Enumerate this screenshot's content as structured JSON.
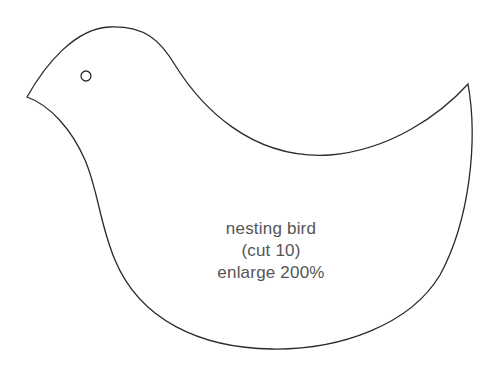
{
  "template": {
    "name": "nesting bird",
    "cut_instruction": "(cut 10)",
    "enlarge_instruction": "enlarge 200%"
  },
  "colors": {
    "background": "#ffffff",
    "outline": "#2a2a2a",
    "text": "#555555"
  }
}
